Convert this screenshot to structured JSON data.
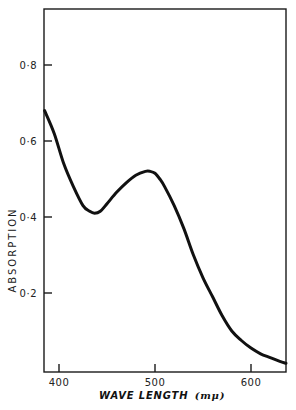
{
  "chart_data": {
    "type": "line",
    "title": "",
    "xlabel": "WAVE LENGTH",
    "xlabel_unit": "(mμ)",
    "ylabel": "ABSORPTION",
    "xlim": [
      385,
      640
    ],
    "ylim": [
      0,
      0.95
    ],
    "grid": false,
    "legend": null,
    "x_ticks": [
      400,
      500,
      600
    ],
    "x_tick_labels": [
      "400",
      "500",
      "600"
    ],
    "y_ticks": [
      0.2,
      0.4,
      0.6,
      0.8
    ],
    "y_tick_labels": [
      "0·2",
      "0·4",
      "0·6",
      "0·8"
    ],
    "series": [
      {
        "name": "absorption",
        "color": "#111111",
        "x": [
          385,
          395,
          405,
          415,
          425,
          432,
          437,
          443,
          450,
          460,
          470,
          480,
          490,
          495,
          500,
          505,
          510,
          520,
          530,
          540,
          550,
          560,
          570,
          580,
          590,
          600,
          610,
          620,
          630,
          640
        ],
        "values": [
          0.68,
          0.62,
          0.54,
          0.48,
          0.43,
          0.415,
          0.41,
          0.415,
          0.435,
          0.465,
          0.49,
          0.51,
          0.52,
          0.52,
          0.515,
          0.5,
          0.48,
          0.43,
          0.37,
          0.3,
          0.24,
          0.19,
          0.14,
          0.1,
          0.075,
          0.055,
          0.04,
          0.03,
          0.02,
          0.015
        ]
      }
    ]
  }
}
